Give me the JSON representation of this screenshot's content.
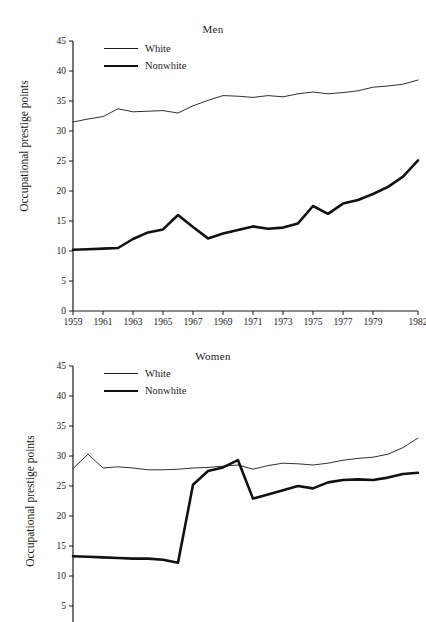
{
  "figure": {
    "ylabel": "Occupational prestige points",
    "legend": {
      "white": "White",
      "nonwhite": "Nonwhite"
    }
  },
  "panels": {
    "men": {
      "title": "Men"
    },
    "women": {
      "title": "Women"
    }
  },
  "chart_data": [
    {
      "type": "line",
      "title": "Men",
      "xlabel": "",
      "ylabel": "Occupational prestige points",
      "ylim": [
        0,
        45
      ],
      "yticks": [
        0,
        5,
        10,
        15,
        20,
        25,
        30,
        35,
        40,
        45
      ],
      "xlim": [
        1959,
        1982
      ],
      "xtick_labels": [
        "1959",
        "1961",
        "1963",
        "1965",
        "1967",
        "1969",
        "1971",
        "1973",
        "1975",
        "1977",
        "1979",
        "1982"
      ],
      "x": [
        1959,
        1960,
        1961,
        1962,
        1963,
        1964,
        1965,
        1966,
        1967,
        1968,
        1969,
        1970,
        1971,
        1972,
        1973,
        1974,
        1975,
        1976,
        1977,
        1978,
        1979,
        1980,
        1981,
        1982
      ],
      "grid": false,
      "legend_position": "top-left",
      "series": [
        {
          "name": "White",
          "style": "thin",
          "values": [
            31.5,
            32.0,
            32.4,
            33.7,
            33.2,
            33.3,
            33.4,
            33.0,
            34.2,
            35.1,
            35.9,
            35.8,
            35.6,
            35.9,
            35.7,
            36.2,
            36.5,
            36.2,
            36.4,
            36.7,
            37.3,
            37.5,
            37.8,
            38.5
          ]
        },
        {
          "name": "Nonwhite",
          "style": "thick",
          "values": [
            10.2,
            10.3,
            10.4,
            10.5,
            12.0,
            13.1,
            13.6,
            16.0,
            14.0,
            12.1,
            12.9,
            13.5,
            14.1,
            13.7,
            13.9,
            14.6,
            17.5,
            16.2,
            17.9,
            18.5,
            19.5,
            20.7,
            22.4,
            25.1
          ]
        }
      ]
    },
    {
      "type": "line",
      "title": "Women",
      "xlabel": "",
      "ylabel": "Occupational prestige points",
      "ylim": [
        0,
        45
      ],
      "yticks": [
        5,
        10,
        15,
        20,
        25,
        30,
        35,
        40,
        45
      ],
      "yticks_visible_note": "panel cropped below the 5 tick",
      "xlim": [
        1959,
        1982
      ],
      "xtick_labels": [],
      "x": [
        1959,
        1960,
        1961,
        1962,
        1963,
        1964,
        1965,
        1966,
        1967,
        1968,
        1969,
        1970,
        1971,
        1972,
        1973,
        1974,
        1975,
        1976,
        1977,
        1978,
        1979,
        1980,
        1981,
        1982
      ],
      "grid": false,
      "legend_position": "top-left",
      "series": [
        {
          "name": "White",
          "style": "thin",
          "values": [
            27.9,
            30.3,
            28.0,
            28.2,
            28.0,
            27.7,
            27.7,
            27.8,
            28.0,
            28.1,
            28.3,
            28.5,
            27.8,
            28.4,
            28.8,
            28.7,
            28.5,
            28.8,
            29.3,
            29.6,
            29.8,
            30.3,
            31.4,
            33.0
          ]
        },
        {
          "name": "Nonwhite",
          "style": "thick",
          "values": [
            13.3,
            13.2,
            13.1,
            13.0,
            12.9,
            12.9,
            12.7,
            12.2,
            25.2,
            27.5,
            28.1,
            29.3,
            22.9,
            23.6,
            24.3,
            25.0,
            24.6,
            25.6,
            26.0,
            26.1,
            26.0,
            26.4,
            27.0,
            27.2
          ]
        }
      ]
    }
  ]
}
